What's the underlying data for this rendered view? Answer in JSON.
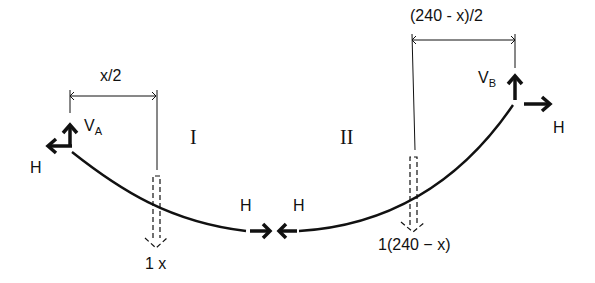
{
  "diagram": {
    "dimensions": {
      "left": "x/2",
      "right": "(240 - x)/2"
    },
    "segments": {
      "left": "I",
      "right": "II"
    },
    "support_A": {
      "vertical": "V",
      "vertical_sub": "A",
      "horizontal": "H"
    },
    "support_B": {
      "vertical": "V",
      "vertical_sub": "B",
      "horizontal": "H"
    },
    "cut": {
      "left_force": "H",
      "right_force": "H"
    },
    "loads": {
      "left": "1 x",
      "right": "1(240 − x)"
    },
    "colors": {
      "ink": "#111111",
      "background": "#ffffff"
    }
  }
}
